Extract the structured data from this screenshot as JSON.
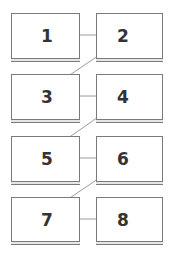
{
  "diagram": {
    "type": "sequence-grid",
    "colors": {
      "border": "#7a7a7a",
      "arrow": "#9a9a9a",
      "text": "#333333"
    },
    "boxes": [
      {
        "id": 1,
        "label": "1",
        "x": 11,
        "y": 13,
        "w": 69,
        "h": 49
      },
      {
        "id": 2,
        "label": "2",
        "x": 96,
        "y": 13,
        "w": 67,
        "h": 49
      },
      {
        "id": 3,
        "label": "3",
        "x": 11,
        "y": 74,
        "w": 69,
        "h": 49
      },
      {
        "id": 4,
        "label": "4",
        "x": 96,
        "y": 74,
        "w": 67,
        "h": 49
      },
      {
        "id": 5,
        "label": "5",
        "x": 11,
        "y": 136,
        "w": 69,
        "h": 49
      },
      {
        "id": 6,
        "label": "6",
        "x": 96,
        "y": 136,
        "w": 67,
        "h": 49
      },
      {
        "id": 7,
        "label": "7",
        "x": 11,
        "y": 197,
        "w": 69,
        "h": 48
      },
      {
        "id": 8,
        "label": "8",
        "x": 96,
        "y": 197,
        "w": 67,
        "h": 48
      }
    ],
    "arrows": [
      {
        "from": 1,
        "to": 2,
        "direction": "horizontal"
      },
      {
        "from": 2,
        "to": 3,
        "direction": "diagonal"
      },
      {
        "from": 3,
        "to": 4,
        "direction": "horizontal"
      },
      {
        "from": 4,
        "to": 5,
        "direction": "diagonal"
      },
      {
        "from": 5,
        "to": 6,
        "direction": "horizontal"
      },
      {
        "from": 6,
        "to": 7,
        "direction": "diagonal"
      },
      {
        "from": 7,
        "to": 8,
        "direction": "horizontal"
      }
    ]
  }
}
